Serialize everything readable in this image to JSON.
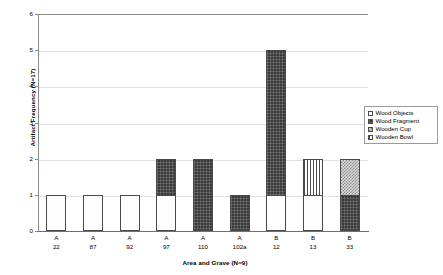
{
  "chart_data": {
    "type": "bar",
    "subtype": "stacked-bar",
    "title": "",
    "xlabel": "Area and Grave (N=9)",
    "ylabel": "Artifact Frequency (N=17)",
    "ylim": [
      0,
      6
    ],
    "yticks": [
      0,
      1,
      2,
      3,
      4,
      5,
      6
    ],
    "grid": true,
    "legend_position": "top-right-inside",
    "categories": [
      "A 22",
      "A 87",
      "A 92",
      "A 97",
      "A 110",
      "A 102a",
      "B 12",
      "B 13",
      "B 33"
    ],
    "category_lines": [
      {
        "line1": "A",
        "line2": "22"
      },
      {
        "line1": "A",
        "line2": "87"
      },
      {
        "line1": "A",
        "line2": "92"
      },
      {
        "line1": "A",
        "line2": "97"
      },
      {
        "line1": "A",
        "line2": "110"
      },
      {
        "line1": "A",
        "line2": "102a"
      },
      {
        "line1": "B",
        "line2": "12"
      },
      {
        "line1": "B",
        "line2": "13"
      },
      {
        "line1": "B",
        "line2": "33"
      }
    ],
    "series": [
      {
        "name": "Wood Objects",
        "pattern": "pat-dots",
        "values": [
          1,
          1,
          1,
          1,
          0,
          0,
          1,
          1,
          0
        ]
      },
      {
        "name": "Wood Fragment",
        "pattern": "pat-dark",
        "values": [
          0,
          0,
          0,
          1,
          2,
          1,
          4,
          0,
          1
        ]
      },
      {
        "name": "Wooden Cup",
        "pattern": "pat-checker",
        "values": [
          0,
          0,
          0,
          0,
          0,
          0,
          0,
          0,
          1
        ]
      },
      {
        "name": "Wooden Bowl",
        "pattern": "pat-stripes",
        "values": [
          0,
          0,
          0,
          0,
          0,
          0,
          0,
          1,
          0
        ]
      }
    ],
    "totals": [
      1,
      1,
      1,
      2,
      2,
      1,
      5,
      2,
      2
    ]
  },
  "legend": {
    "items": [
      {
        "label": "Wood Objects",
        "pattern": "pat-dots"
      },
      {
        "label": "Wood Fragment",
        "pattern": "pat-dark"
      },
      {
        "label": "Wooden Cup",
        "pattern": "pat-checker"
      },
      {
        "label": "Wooden Bowl",
        "pattern": "pat-stripes"
      }
    ]
  }
}
